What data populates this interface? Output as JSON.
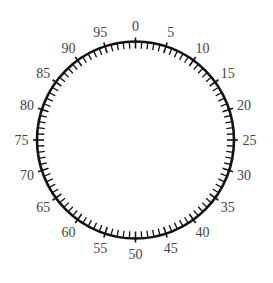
{
  "dial": {
    "center": [
      135.5,
      140
    ],
    "radius": 98.5,
    "total_divisions": 100,
    "major_every": 5,
    "minor_tick_inward": 7,
    "major_tick_inward": 7,
    "major_tick_outward": 4,
    "label_radius": 114,
    "stroke_color": "#111111",
    "label_color": "#444444",
    "labels": [
      "0",
      "5",
      "10",
      "15",
      "20",
      "25",
      "30",
      "35",
      "40",
      "45",
      "50",
      "55",
      "60",
      "65",
      "70",
      "75",
      "80",
      "85",
      "90",
      "95"
    ]
  }
}
